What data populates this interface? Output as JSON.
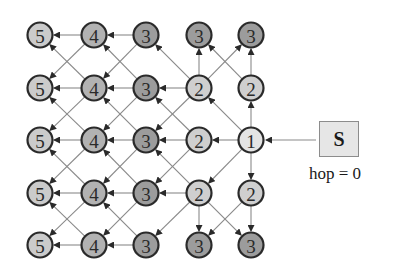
{
  "diagram": {
    "title": "",
    "grid": {
      "cols_x": [
        40,
        94,
        146,
        199,
        251
      ],
      "rows_y": [
        35,
        88,
        140,
        193,
        245
      ],
      "node_radius": 12.5
    },
    "nodes": [
      [
        {
          "hop": "5"
        },
        {
          "hop": "4"
        },
        {
          "hop": "3"
        },
        {
          "hop": "3"
        },
        {
          "hop": "3"
        }
      ],
      [
        {
          "hop": "5"
        },
        {
          "hop": "4"
        },
        {
          "hop": "3"
        },
        {
          "hop": "2"
        },
        {
          "hop": "2"
        }
      ],
      [
        {
          "hop": "5"
        },
        {
          "hop": "4"
        },
        {
          "hop": "3"
        },
        {
          "hop": "2"
        },
        {
          "hop": "1"
        }
      ],
      [
        {
          "hop": "5"
        },
        {
          "hop": "4"
        },
        {
          "hop": "3"
        },
        {
          "hop": "2"
        },
        {
          "hop": "2"
        }
      ],
      [
        {
          "hop": "5"
        },
        {
          "hop": "4"
        },
        {
          "hop": "3"
        },
        {
          "hop": "3"
        },
        {
          "hop": "3"
        }
      ]
    ],
    "hop_colors": {
      "1": "#e4e4e4",
      "2": "#cfcfcf",
      "3": "#9c9c9c",
      "4": "#b2b2b2",
      "5": "#cbcbcb"
    },
    "edges": [
      [
        [
          2,
          4
        ],
        [
          2,
          3
        ]
      ],
      [
        [
          2,
          4
        ],
        [
          1,
          4
        ]
      ],
      [
        [
          2,
          4
        ],
        [
          3,
          4
        ]
      ],
      [
        [
          2,
          4
        ],
        [
          1,
          3
        ]
      ],
      [
        [
          2,
          4
        ],
        [
          3,
          3
        ]
      ],
      [
        [
          1,
          4
        ],
        [
          0,
          4
        ]
      ],
      [
        [
          1,
          4
        ],
        [
          0,
          3
        ]
      ],
      [
        [
          3,
          4
        ],
        [
          4,
          4
        ]
      ],
      [
        [
          3,
          4
        ],
        [
          4,
          3
        ]
      ],
      [
        [
          1,
          3
        ],
        [
          0,
          3
        ]
      ],
      [
        [
          1,
          3
        ],
        [
          0,
          4
        ]
      ],
      [
        [
          1,
          3
        ],
        [
          1,
          2
        ]
      ],
      [
        [
          1,
          3
        ],
        [
          0,
          2
        ]
      ],
      [
        [
          1,
          3
        ],
        [
          2,
          2
        ]
      ],
      [
        [
          3,
          3
        ],
        [
          4,
          3
        ]
      ],
      [
        [
          3,
          3
        ],
        [
          4,
          4
        ]
      ],
      [
        [
          3,
          3
        ],
        [
          3,
          2
        ]
      ],
      [
        [
          3,
          3
        ],
        [
          4,
          2
        ]
      ],
      [
        [
          3,
          3
        ],
        [
          2,
          2
        ]
      ],
      [
        [
          2,
          3
        ],
        [
          2,
          2
        ]
      ],
      [
        [
          2,
          3
        ],
        [
          1,
          2
        ]
      ],
      [
        [
          2,
          3
        ],
        [
          3,
          2
        ]
      ],
      [
        [
          0,
          2
        ],
        [
          0,
          1
        ]
      ],
      [
        [
          0,
          2
        ],
        [
          1,
          1
        ]
      ],
      [
        [
          1,
          2
        ],
        [
          1,
          1
        ]
      ],
      [
        [
          1,
          2
        ],
        [
          0,
          1
        ]
      ],
      [
        [
          1,
          2
        ],
        [
          2,
          1
        ]
      ],
      [
        [
          2,
          2
        ],
        [
          2,
          1
        ]
      ],
      [
        [
          2,
          2
        ],
        [
          1,
          1
        ]
      ],
      [
        [
          2,
          2
        ],
        [
          3,
          1
        ]
      ],
      [
        [
          3,
          2
        ],
        [
          3,
          1
        ]
      ],
      [
        [
          3,
          2
        ],
        [
          2,
          1
        ]
      ],
      [
        [
          3,
          2
        ],
        [
          4,
          1
        ]
      ],
      [
        [
          4,
          2
        ],
        [
          4,
          1
        ]
      ],
      [
        [
          4,
          2
        ],
        [
          3,
          1
        ]
      ],
      [
        [
          0,
          1
        ],
        [
          0,
          0
        ]
      ],
      [
        [
          0,
          1
        ],
        [
          1,
          0
        ]
      ],
      [
        [
          1,
          1
        ],
        [
          1,
          0
        ]
      ],
      [
        [
          1,
          1
        ],
        [
          0,
          0
        ]
      ],
      [
        [
          1,
          1
        ],
        [
          2,
          0
        ]
      ],
      [
        [
          2,
          1
        ],
        [
          2,
          0
        ]
      ],
      [
        [
          2,
          1
        ],
        [
          1,
          0
        ]
      ],
      [
        [
          2,
          1
        ],
        [
          3,
          0
        ]
      ],
      [
        [
          3,
          1
        ],
        [
          3,
          0
        ]
      ],
      [
        [
          3,
          1
        ],
        [
          2,
          0
        ]
      ],
      [
        [
          3,
          1
        ],
        [
          4,
          0
        ]
      ],
      [
        [
          4,
          1
        ],
        [
          4,
          0
        ]
      ],
      [
        [
          4,
          1
        ],
        [
          3,
          0
        ]
      ]
    ],
    "source": {
      "label": "S",
      "hop_text": "hop = 0",
      "arrow": {
        "from": [
          316,
          140
        ],
        "to": [
          266,
          140
        ]
      }
    }
  }
}
